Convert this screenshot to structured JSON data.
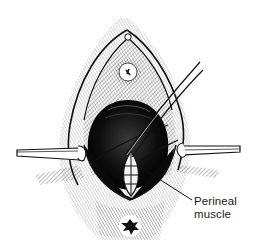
{
  "figure": {
    "colors": {
      "ink": "#111111",
      "background": "#ffffff",
      "cavity": "#0d0d0d"
    }
  },
  "annotations": [
    {
      "id": "perineal-muscle",
      "lines": [
        "Perineal",
        "muscle"
      ]
    }
  ]
}
